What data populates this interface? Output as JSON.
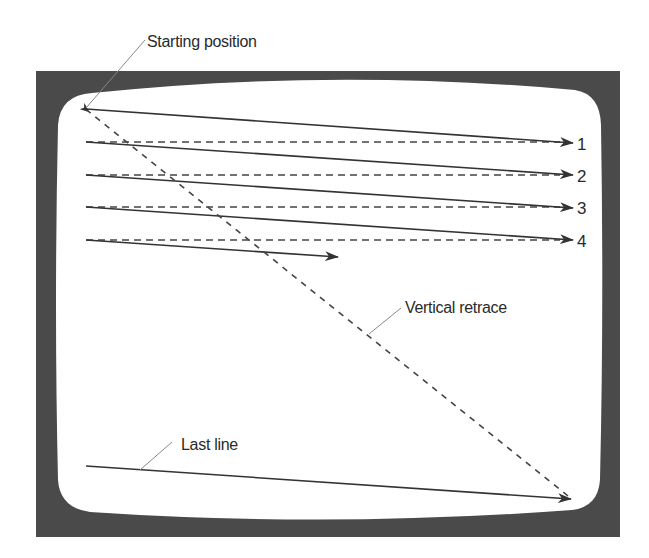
{
  "diagram": {
    "title": "",
    "labels": {
      "starting_position": "Starting position",
      "vertical_retrace": "Vertical retrace",
      "last_line": "Last line"
    },
    "scan_lines": [
      {
        "number": "1"
      },
      {
        "number": "2"
      },
      {
        "number": "3"
      },
      {
        "number": "4"
      }
    ],
    "colors": {
      "frame": "#4a4a4a",
      "screen": "#ffffff",
      "line": "#333333",
      "leader": "#888888"
    }
  }
}
